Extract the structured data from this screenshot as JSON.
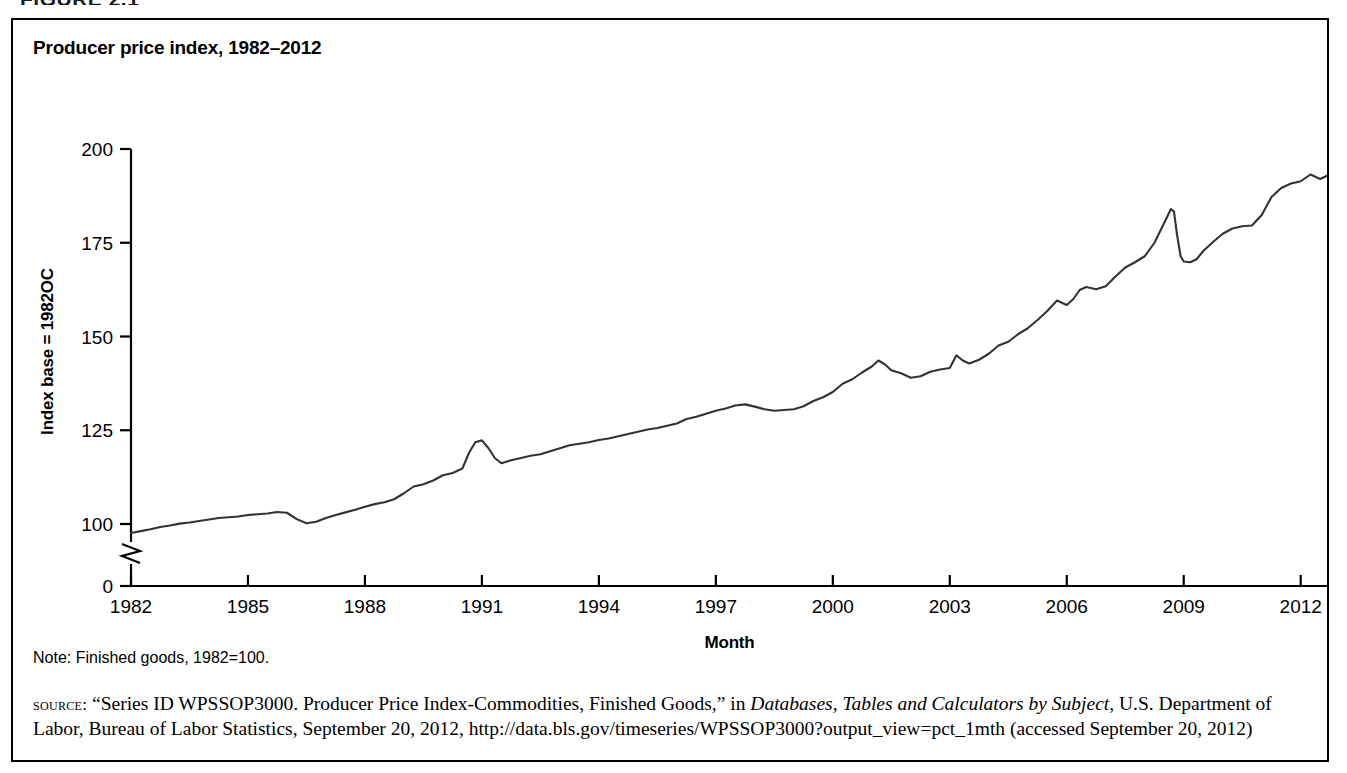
{
  "figure": {
    "heading": "FIGURE 2.1"
  },
  "chart_title": "Producer price index, 1982–2012",
  "note": "Note: Finished goods, 1982=100.",
  "source": {
    "label": "source:",
    "text_before_italic": " “Series ID WPSSOP3000. Producer Price Index-Commodities, Finished Goods,” in ",
    "italic_title": "Databases, Tables and Calculators by Subject",
    "text_after_italic": ", U.S. Department of Labor, Bureau of Labor Statistics, September 20, 2012, http://data.bls.gov/timeseries/WPSSOP3000?output_view=pct_1mth (accessed September 20, 2012)"
  },
  "chart_data": {
    "type": "line",
    "title": "Producer price index, 1982–2012",
    "xlabel": "Month",
    "ylabel": "Index base = 1982OC",
    "xlim": [
      1982,
      2012.7
    ],
    "ylim": [
      0,
      200
    ],
    "y_axis_break": true,
    "y_break_between": [
      0,
      90
    ],
    "grid": false,
    "legend": false,
    "line_color": "#333333",
    "xticks": [
      1982,
      1985,
      1988,
      1991,
      1994,
      1997,
      2000,
      2003,
      2006,
      2009,
      2012
    ],
    "xtick_labels": [
      "1982",
      "1985",
      "1988",
      "1991",
      "1994",
      "1997",
      "2000",
      "2003",
      "2006",
      "2009",
      "2012"
    ],
    "yticks": [
      0,
      100,
      125,
      150,
      175,
      200
    ],
    "ytick_labels": [
      "0",
      "100",
      "125",
      "150",
      "175",
      "200"
    ],
    "series": [
      {
        "name": "Producer price index, finished goods (1982=100)",
        "x": [
          1982.0,
          1982.25,
          1982.5,
          1982.75,
          1983.0,
          1983.25,
          1983.5,
          1983.75,
          1984.0,
          1984.25,
          1984.5,
          1984.75,
          1985.0,
          1985.25,
          1985.5,
          1985.75,
          1986.0,
          1986.25,
          1986.5,
          1986.75,
          1987.0,
          1987.25,
          1987.5,
          1987.75,
          1988.0,
          1988.25,
          1988.5,
          1988.75,
          1989.0,
          1989.25,
          1989.5,
          1989.75,
          1990.0,
          1990.25,
          1990.5,
          1990.67,
          1990.83,
          1991.0,
          1991.17,
          1991.33,
          1991.5,
          1991.75,
          1992.0,
          1992.25,
          1992.5,
          1992.75,
          1993.0,
          1993.25,
          1993.5,
          1993.75,
          1994.0,
          1994.25,
          1994.5,
          1994.75,
          1995.0,
          1995.25,
          1995.5,
          1995.75,
          1996.0,
          1996.25,
          1996.5,
          1996.75,
          1997.0,
          1997.25,
          1997.5,
          1997.75,
          1998.0,
          1998.25,
          1998.5,
          1998.75,
          1999.0,
          1999.25,
          1999.5,
          1999.75,
          2000.0,
          2000.25,
          2000.5,
          2000.75,
          2001.0,
          2001.17,
          2001.33,
          2001.5,
          2001.75,
          2002.0,
          2002.25,
          2002.5,
          2002.75,
          2003.0,
          2003.17,
          2003.33,
          2003.5,
          2003.75,
          2004.0,
          2004.25,
          2004.5,
          2004.75,
          2005.0,
          2005.25,
          2005.5,
          2005.75,
          2006.0,
          2006.17,
          2006.33,
          2006.5,
          2006.75,
          2007.0,
          2007.25,
          2007.5,
          2007.75,
          2008.0,
          2008.25,
          2008.42,
          2008.58,
          2008.67,
          2008.75,
          2008.83,
          2008.92,
          2009.0,
          2009.17,
          2009.33,
          2009.5,
          2009.75,
          2010.0,
          2010.25,
          2010.5,
          2010.75,
          2011.0,
          2011.25,
          2011.5,
          2011.75,
          2012.0,
          2012.25,
          2012.5,
          2012.7
        ],
        "y": [
          97.6,
          98.1,
          98.6,
          99.2,
          99.6,
          100.1,
          100.4,
          100.8,
          101.2,
          101.6,
          101.8,
          102.0,
          102.4,
          102.6,
          102.8,
          103.2,
          103.0,
          101.3,
          100.2,
          100.6,
          101.6,
          102.4,
          103.1,
          103.8,
          104.6,
          105.3,
          105.8,
          106.6,
          108.2,
          110.0,
          110.6,
          111.6,
          113.0,
          113.6,
          114.8,
          119.0,
          121.8,
          122.3,
          120.2,
          117.6,
          116.2,
          117.0,
          117.6,
          118.2,
          118.6,
          119.4,
          120.2,
          121.0,
          121.4,
          121.8,
          122.4,
          122.8,
          123.4,
          124.0,
          124.6,
          125.2,
          125.6,
          126.2,
          126.8,
          128.0,
          128.6,
          129.4,
          130.2,
          130.8,
          131.6,
          131.9,
          131.3,
          130.6,
          130.2,
          130.4,
          130.6,
          131.4,
          132.8,
          133.8,
          135.2,
          137.4,
          138.6,
          140.4,
          142.0,
          143.6,
          142.6,
          141.0,
          140.2,
          139.0,
          139.4,
          140.6,
          141.2,
          141.6,
          145.0,
          143.6,
          142.8,
          143.8,
          145.4,
          147.6,
          148.6,
          150.6,
          152.2,
          154.4,
          156.8,
          159.6,
          158.4,
          160.0,
          162.4,
          163.2,
          162.6,
          163.4,
          166.0,
          168.4,
          169.8,
          171.4,
          175.0,
          178.6,
          182.0,
          184.0,
          183.3,
          177.0,
          171.4,
          170.0,
          169.8,
          170.6,
          172.8,
          175.2,
          177.4,
          178.8,
          179.4,
          179.6,
          182.4,
          187.2,
          189.6,
          190.8,
          191.4,
          193.2,
          192.0,
          193.0
        ]
      }
    ],
    "annotations": [
      {
        "label": "1990 Gulf War spike",
        "x": 1990.83,
        "y": 121.8
      },
      {
        "label": "2008 commodity peak",
        "x": 2008.67,
        "y": 184.0
      },
      {
        "label": "2009 recession trough",
        "x": 2009.0,
        "y": 170.0
      }
    ]
  }
}
